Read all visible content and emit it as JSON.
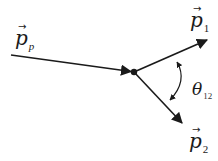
{
  "diagram": {
    "type": "particle-decay-vector-diagram",
    "colors": {
      "background": "#ffffff",
      "stroke": "#1a1a1a"
    },
    "labels": {
      "incoming": {
        "symbol": "p",
        "vector_arrow": "→",
        "subscript": "p"
      },
      "outgoing_1": {
        "symbol": "p",
        "vector_arrow": "→",
        "subscript": "1"
      },
      "outgoing_2": {
        "symbol": "p",
        "vector_arrow": "→",
        "subscript": "2"
      },
      "angle": {
        "symbol": "θ",
        "subscript": "12"
      }
    },
    "geometry": {
      "vertex": [
        134,
        72
      ],
      "incoming_start": [
        11,
        55
      ],
      "outgoing_1_end": [
        207,
        40
      ],
      "outgoing_2_end": [
        182,
        123
      ],
      "angle_arc": {
        "start": [
          177,
          62
        ],
        "end": [
          170,
          100
        ],
        "bulge_x": 183
      }
    }
  }
}
